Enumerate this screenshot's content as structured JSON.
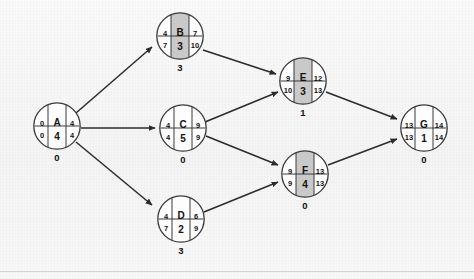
{
  "diagram": {
    "type": "activity-on-node",
    "colors": {
      "background": "#f6f6f6",
      "node_fill": "#fdfdfd",
      "node_stroke": "#3a3a3a",
      "center_shaded_fill": "#c9c9c9",
      "center_plain_fill": "#fdfdfd",
      "edge_stroke": "#2b2b2b",
      "text": "#15120f",
      "rule": "#d2d4d8"
    },
    "legend_layout": {
      "top_left": "earliest_start",
      "top_right": "earliest_finish",
      "bottom_left": "latest_start",
      "bottom_right": "latest_finish",
      "center_top": "activity_name",
      "center_bottom": "duration",
      "below_circle": "slack"
    },
    "nodes": [
      {
        "id": "A",
        "name": "A",
        "es": "0",
        "ef": "4",
        "ls": "0",
        "lf": "4",
        "duration": "4",
        "slack": "0",
        "shaded": false,
        "x": 33,
        "y": 102
      },
      {
        "id": "B",
        "name": "B",
        "es": "4",
        "ef": "7",
        "ls": "7",
        "lf": "10",
        "duration": "3",
        "slack": "3",
        "shaded": true,
        "x": 156,
        "y": 12
      },
      {
        "id": "C",
        "name": "C",
        "es": "4",
        "ef": "9",
        "ls": "4",
        "lf": "9",
        "duration": "5",
        "slack": "0",
        "shaded": false,
        "x": 159,
        "y": 104
      },
      {
        "id": "D",
        "name": "D",
        "es": "4",
        "ef": "6",
        "ls": "7",
        "lf": "9",
        "duration": "2",
        "slack": "3",
        "shaded": false,
        "x": 157,
        "y": 195
      },
      {
        "id": "E",
        "name": "E",
        "es": "9",
        "ef": "12",
        "ls": "10",
        "lf": "13",
        "duration": "3",
        "slack": "1",
        "shaded": true,
        "x": 279,
        "y": 57
      },
      {
        "id": "F",
        "name": "F",
        "es": "9",
        "ef": "13",
        "ls": "9",
        "lf": "13",
        "duration": "4",
        "slack": "0",
        "shaded": true,
        "x": 281,
        "y": 150
      },
      {
        "id": "G",
        "name": "G",
        "es": "13",
        "ef": "14",
        "ls": "13",
        "lf": "14",
        "duration": "1",
        "slack": "0",
        "shaded": false,
        "x": 400,
        "y": 104
      }
    ],
    "edges": [
      {
        "from": "A",
        "to": "B",
        "x1": 76,
        "y1": 113,
        "x2": 152,
        "y2": 47
      },
      {
        "from": "A",
        "to": "C",
        "x1": 81,
        "y1": 128,
        "x2": 155,
        "y2": 128
      },
      {
        "from": "A",
        "to": "D",
        "x1": 76,
        "y1": 142,
        "x2": 152,
        "y2": 205
      },
      {
        "from": "B",
        "to": "E",
        "x1": 203,
        "y1": 50,
        "x2": 276,
        "y2": 74
      },
      {
        "from": "C",
        "to": "E",
        "x1": 205,
        "y1": 122,
        "x2": 278,
        "y2": 92
      },
      {
        "from": "C",
        "to": "F",
        "x1": 206,
        "y1": 136,
        "x2": 278,
        "y2": 165
      },
      {
        "from": "D",
        "to": "F",
        "x1": 204,
        "y1": 212,
        "x2": 278,
        "y2": 182
      },
      {
        "from": "E",
        "to": "G",
        "x1": 326,
        "y1": 92,
        "x2": 397,
        "y2": 119
      },
      {
        "from": "F",
        "to": "G",
        "x1": 328,
        "y1": 165,
        "x2": 397,
        "y2": 139
      }
    ],
    "bottom_rule_y": 271
  }
}
